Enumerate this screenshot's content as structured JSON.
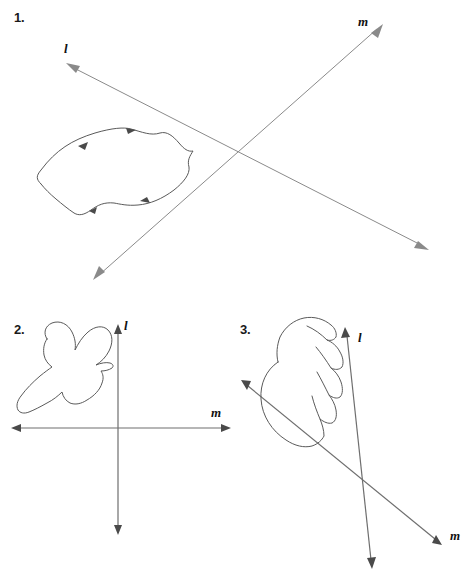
{
  "page": {
    "background_color": "#ffffff",
    "width": 466,
    "height": 584
  },
  "colors": {
    "line_gray": "#8a8a8a",
    "axis_gray": "#6e6e6e",
    "shape_gray": "#5a5a5a",
    "text_black": "#1a1a1a"
  },
  "figures": [
    {
      "number": "1.",
      "shape_name": "leaf-shape",
      "lines": [
        {
          "label": "l",
          "label_x": 67,
          "label_y": 48,
          "x1": 69,
          "y1": 66,
          "x2": 426,
          "y2": 248,
          "arrow_start": true,
          "arrow_end": true
        },
        {
          "label": "m",
          "label_x": 360,
          "label_y": 22,
          "x1": 380,
          "y1": 26,
          "x2": 96,
          "y2": 278,
          "arrow_start": true,
          "arrow_end": true
        }
      ]
    },
    {
      "number": "2.",
      "shape_name": "bird-shape",
      "lines": [
        {
          "label": "l",
          "label_x": 125,
          "label_y": 24,
          "x1": 118,
          "y1": 27,
          "x2": 118,
          "y2": 230,
          "arrow_start": true,
          "arrow_end": true
        },
        {
          "label": "m",
          "label_x": 213,
          "label_y": 112,
          "x1": 229,
          "y1": 128,
          "x2": 12,
          "y2": 128,
          "arrow_start": true,
          "arrow_end": true
        }
      ]
    },
    {
      "number": "3.",
      "shape_name": "shell-shape",
      "lines": [
        {
          "label": "l",
          "label_x": 128,
          "label_y": 36,
          "x1": 113,
          "y1": 28,
          "x2": 140,
          "y2": 268,
          "arrow_start": true,
          "arrow_end": true
        },
        {
          "label": "m",
          "label_x": 220,
          "label_y": 234,
          "x1": 8,
          "y1": 80,
          "x2": 209,
          "y2": 244,
          "arrow_start": true,
          "arrow_end": true
        }
      ]
    }
  ]
}
